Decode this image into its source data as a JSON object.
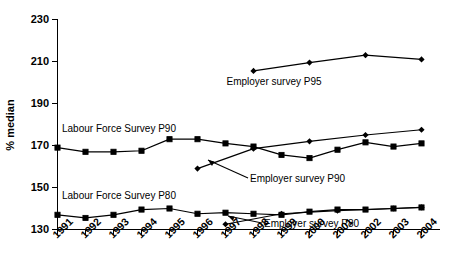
{
  "chart_data": {
    "type": "line",
    "title": "",
    "xlabel": "",
    "ylabel": "% median",
    "ylim": [
      130,
      230
    ],
    "yticks": [
      130,
      150,
      170,
      190,
      210,
      230
    ],
    "xlim": [
      1991,
      2004
    ],
    "grid": false,
    "legend_position": "inline-annotations",
    "categories": [
      "1991",
      "1992",
      "1993",
      "1994",
      "1995",
      "1996",
      "1997",
      "1998",
      "1999",
      "2000",
      "2001",
      "2002",
      "2003",
      "2004"
    ],
    "series": [
      {
        "name": "Employer survey P95",
        "marker": "diamond",
        "x": [
          "1998",
          "1999",
          "2000",
          "2001",
          "2002",
          "2003",
          "2004"
        ],
        "values": [
          205.5,
          null,
          209.5,
          null,
          213,
          null,
          211
        ],
        "points": [
          {
            "x": "1998",
            "y": 205.5
          },
          {
            "x": "2000",
            "y": 209.5
          },
          {
            "x": "2002",
            "y": 213.0
          },
          {
            "x": "2004",
            "y": 211.0
          }
        ]
      },
      {
        "name": "Labour Force Survey P90",
        "marker": "square",
        "x": [
          "1991",
          "1992",
          "1993",
          "1994",
          "1995",
          "1996",
          "1997",
          "1998",
          "1999",
          "2000",
          "2001",
          "2002",
          "2003",
          "2004"
        ],
        "values": [
          169.0,
          167.0,
          167.0,
          167.5,
          173.0,
          173.0,
          171.0,
          169.5,
          165.5,
          164.0,
          168.0,
          171.5,
          169.5,
          171.0
        ]
      },
      {
        "name": "Employer survey P90",
        "marker": "diamond",
        "x": [
          "1996",
          "1997",
          "1998",
          "1999",
          "2000",
          "2001",
          "2002",
          "2003",
          "2004"
        ],
        "values": [
          159.0,
          163.5,
          168.5,
          169.5,
          172.0,
          173.5,
          175.0,
          176.0,
          177.5
        ],
        "points": [
          {
            "x": "1996",
            "y": 159.0
          },
          {
            "x": "1998",
            "y": 168.5
          },
          {
            "x": "2000",
            "y": 172.0
          },
          {
            "x": "2002",
            "y": 175.0
          },
          {
            "x": "2004",
            "y": 177.5
          }
        ]
      },
      {
        "name": "Labour Force Survey P80",
        "marker": "square",
        "x": [
          "1991",
          "1992",
          "1993",
          "1994",
          "1995",
          "1996",
          "1997",
          "1998",
          "1999",
          "2000",
          "2001",
          "2002",
          "2003",
          "2004"
        ],
        "values": [
          137.0,
          135.5,
          137.0,
          139.5,
          140.0,
          137.5,
          138.0,
          137.5,
          137.0,
          138.5,
          139.5,
          139.5,
          140.0,
          140.5
        ]
      },
      {
        "name": "Employer survey P80",
        "marker": "diamond",
        "x": [
          "1997",
          "1998",
          "1999",
          "2000",
          "2001",
          "2002",
          "2003",
          "2004"
        ],
        "values": [
          132.5,
          136.5,
          137.5,
          137.5,
          139.0,
          139.5,
          140.0,
          140.5
        ],
        "points": [
          {
            "x": "1997",
            "y": 132.5
          },
          {
            "x": "1999",
            "y": 137.5
          },
          {
            "x": "2001",
            "y": 139.0
          },
          {
            "x": "2003",
            "y": 140.0
          },
          {
            "x": "2004",
            "y": 140.5
          }
        ]
      }
    ],
    "annotations": [
      {
        "id": "ann-p95",
        "text": "Employer survey P95"
      },
      {
        "id": "ann-lfs-p90",
        "text": "Labour Force Survey P90"
      },
      {
        "id": "ann-emp-p90",
        "text": "Employer survey P90"
      },
      {
        "id": "ann-lfs-p80",
        "text": "Labour Force Survey P80"
      },
      {
        "id": "ann-emp-p80",
        "text": "Employer survey P80"
      }
    ],
    "colors": {
      "line": "#000000",
      "marker": "#000000",
      "axis": "#000000",
      "background": "#ffffff"
    }
  }
}
